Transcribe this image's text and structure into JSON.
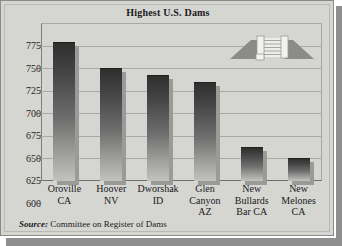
{
  "chart_data": {
    "type": "bar",
    "title": "Highest U.S. Dams",
    "categories": [
      "Oroville\nCA",
      "Hoover\nNV",
      "Dworshak\nID",
      "Glen\nCanyon\nAZ",
      "New\nBullards\nBar CA",
      "New\nMelones\nCA"
    ],
    "category_lines": [
      [
        "Oroville",
        "CA"
      ],
      [
        "Hoover",
        "NV"
      ],
      [
        "Dworshak",
        "ID"
      ],
      [
        "Glen",
        "Canyon",
        "AZ"
      ],
      [
        "New",
        "Bullards",
        "Bar CA"
      ],
      [
        "New",
        "Melones",
        "CA"
      ]
    ],
    "values": [
      754,
      725,
      717,
      710,
      638,
      626
    ],
    "xlabel": "",
    "ylabel": "",
    "ylim": [
      600,
      775
    ],
    "yticks": [
      600,
      625,
      650,
      675,
      700,
      725,
      750,
      775
    ],
    "ytick_labels": [
      "600",
      "625",
      "650",
      "675",
      "700",
      "725",
      "750",
      "775"
    ],
    "grid": true,
    "legend": false,
    "series_color": "#454545"
  },
  "footer": {
    "source_word": "Source:",
    "source_text": " Committee on Register of Dams"
  },
  "decor": {
    "logo_name": "dam-illustration",
    "logo_fill_bank": "#8f8f8d",
    "logo_fill_wall": "#e2e2df"
  },
  "colors": {
    "panel_background": "#d5d5d2",
    "grid": "#a9a9a6",
    "text": "#1a1a1a",
    "shadow": "#8e8e8e"
  }
}
